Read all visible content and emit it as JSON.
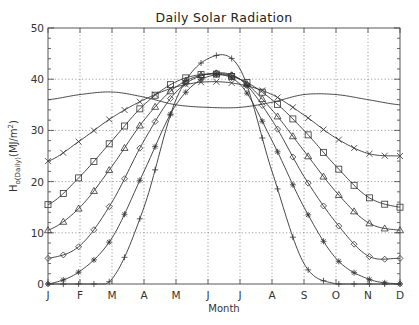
{
  "chart_data": {
    "type": "line",
    "title": "Daily Solar Radiation",
    "xlabel": "Month",
    "ylabel": "H0(Daily)(MJ/m2)",
    "ylabel_parts": {
      "main": "H",
      "sub": "o(Daily)",
      "unit_open": "(MJ/m",
      "sup": "2",
      "unit_close": ")"
    },
    "categories": [
      "J",
      "F",
      "M",
      "A",
      "M",
      "J",
      "J",
      "A",
      "S",
      "O",
      "N",
      "D"
    ],
    "ylim": [
      0,
      50
    ],
    "yticks": [
      0,
      10,
      20,
      30,
      40,
      50
    ],
    "grid": true,
    "legend": "none",
    "series": [
      {
        "name": "equator (no markers)",
        "marker": "none",
        "values": [
          36,
          37,
          37.5,
          36.5,
          35,
          34.5,
          34.5,
          35.5,
          37,
          37,
          36,
          35
        ]
      },
      {
        "name": "x-marker series",
        "marker": "x",
        "values": [
          24,
          28,
          32.5,
          36,
          38.5,
          39.5,
          39,
          37,
          33,
          28.5,
          25.5,
          25
        ]
      },
      {
        "name": "square-marker series",
        "marker": "square",
        "values": [
          15.5,
          21,
          28,
          35,
          39.5,
          41,
          40,
          36,
          30,
          23,
          17,
          15
        ]
      },
      {
        "name": "triangle-marker series",
        "marker": "triangle",
        "values": [
          10.5,
          15,
          23,
          32,
          38.5,
          41,
          40,
          34,
          26,
          18,
          12,
          10.5
        ]
      },
      {
        "name": "diamond-marker series",
        "marker": "diamond",
        "values": [
          5,
          7.5,
          16,
          28,
          37.5,
          41,
          40,
          32,
          21,
          12,
          5.5,
          5
        ]
      },
      {
        "name": "asterisk-marker series",
        "marker": "asterisk",
        "values": [
          0,
          2.5,
          9,
          22,
          35,
          40.5,
          39,
          28,
          15,
          5,
          1,
          0
        ]
      },
      {
        "name": "plus-marker series",
        "marker": "plus",
        "values": [
          0,
          0,
          1,
          15,
          36,
          44,
          42,
          22,
          4,
          0,
          0,
          0
        ]
      }
    ]
  }
}
